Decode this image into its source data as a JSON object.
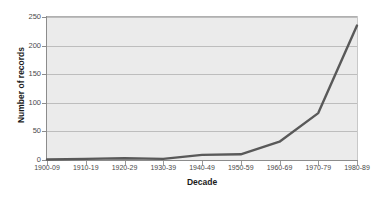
{
  "chart_data": {
    "type": "line",
    "title": "",
    "subtitle": "",
    "xlabel": "Decade",
    "ylabel": "Number of records",
    "categories": [
      "1900-09",
      "1910-19",
      "1920-29",
      "1930-39",
      "1940-49",
      "1950-59",
      "1960-69",
      "1970-79",
      "1980-89"
    ],
    "values": [
      1,
      2,
      3,
      2,
      9,
      10,
      32,
      82,
      235
    ],
    "series": [
      {
        "name": "Number of records",
        "values": [
          1,
          2,
          3,
          2,
          9,
          10,
          32,
          82,
          235
        ]
      }
    ],
    "ylim": [
      0,
      250
    ],
    "yticks": [
      0,
      50,
      100,
      150,
      200,
      250
    ],
    "ytick_labels": [
      "0",
      "50",
      "100",
      "150",
      "200",
      "250"
    ],
    "grid": true,
    "grid_axis": "y",
    "legend": false,
    "legend_position": "none",
    "markers": false,
    "annotations": [],
    "colors": {
      "line": "#595959",
      "plot_background": "#ebebeb",
      "figure_background": "#ffffff",
      "gridline": "#bdbdbd",
      "axis": "#8c8c8c",
      "tick_text": "#4a4a4a",
      "title_text": "#1a1a1a"
    },
    "line_width": 2.4
  }
}
